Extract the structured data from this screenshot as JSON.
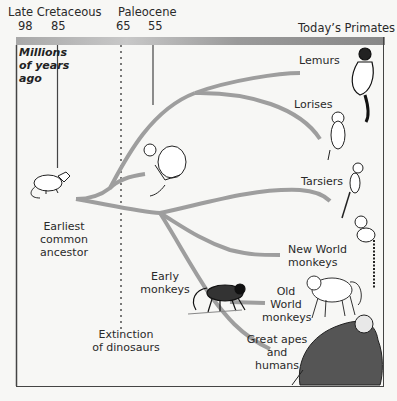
{
  "header": {
    "periods": [
      {
        "name": "Late Cretaceous"
      },
      {
        "name": "Paleocene"
      }
    ],
    "ticks": [
      "98",
      "85",
      "65",
      "55"
    ],
    "right_title": "Today’s Primates"
  },
  "axis_label": {
    "line1": "Millions",
    "line2": "of years",
    "line3": "ago"
  },
  "ancestor": {
    "line1": "Earliest",
    "line2": "common",
    "line3": "ancestor"
  },
  "extinction": {
    "line1": "Extinction",
    "line2": "of dinosaurs"
  },
  "early_monkeys": {
    "line1": "Early",
    "line2": "monkeys"
  },
  "groups": [
    {
      "id": "lemurs",
      "lines": [
        "Lemurs"
      ]
    },
    {
      "id": "lorises",
      "lines": [
        "Lorises"
      ]
    },
    {
      "id": "tarsiers",
      "lines": [
        "Tarsiers"
      ]
    },
    {
      "id": "new-world-monkeys",
      "lines": [
        "New World",
        "monkeys"
      ]
    },
    {
      "id": "old-world-monkeys",
      "lines": [
        "Old",
        "World",
        "monkeys"
      ]
    },
    {
      "id": "great-apes-humans",
      "lines": [
        "Great apes",
        "and",
        "humans"
      ]
    }
  ],
  "colors": {
    "branch": "#9e9e9e",
    "frame": "#444444",
    "text": "#2a2a2a"
  }
}
